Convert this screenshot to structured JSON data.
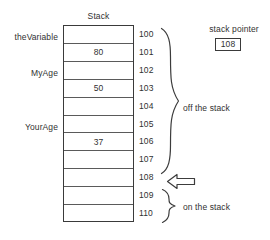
{
  "diagram": {
    "title": "Stack",
    "table": {
      "rows": [
        {
          "address": "100",
          "value": "",
          "var_label": ""
        },
        {
          "address": "101",
          "value": "80",
          "var_label": "theVariable"
        },
        {
          "address": "102",
          "value": "",
          "var_label": ""
        },
        {
          "address": "103",
          "value": "50",
          "var_label": "MyAge"
        },
        {
          "address": "104",
          "value": "",
          "var_label": ""
        },
        {
          "address": "105",
          "value": "",
          "var_label": ""
        },
        {
          "address": "106",
          "value": "37",
          "var_label": "YourAge"
        },
        {
          "address": "107",
          "value": "",
          "var_label": ""
        },
        {
          "address": "108",
          "value": "",
          "var_label": ""
        },
        {
          "address": "109",
          "value": "",
          "var_label": ""
        },
        {
          "address": "110",
          "value": "",
          "var_label": ""
        }
      ]
    },
    "annotations": {
      "off_the_stack": "off the stack",
      "on_the_stack": "on the stack"
    },
    "stack_pointer": {
      "label": "stack pointer",
      "value": "108",
      "points_to_address": "108"
    },
    "colors": {
      "background": "#ffffff",
      "ink": "#313131",
      "rule": "#3a3a3a",
      "inner_rule": "#5a5a5a"
    }
  }
}
